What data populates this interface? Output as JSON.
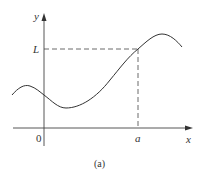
{
  "figure": {
    "caption": "(a)",
    "axes": {
      "x_label": "x",
      "y_label": "y",
      "origin_label": "0"
    },
    "marks": {
      "x_mark": "a",
      "y_mark": "L"
    },
    "colors": {
      "line": "#333333",
      "background": "#ffffff"
    }
  }
}
